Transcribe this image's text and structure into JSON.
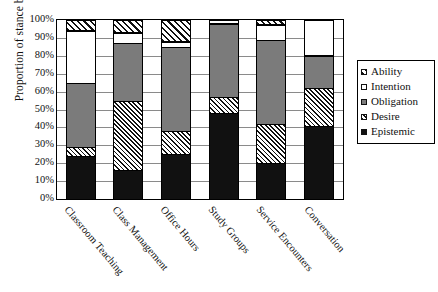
{
  "chart_data": {
    "type": "bar",
    "subtype": "stacked-100-percent",
    "title": "",
    "xlabel": "",
    "ylabel": "Proportion of stance bundles",
    "ylim": [
      0,
      100
    ],
    "ytick_labels": [
      "0%",
      "10%",
      "20%",
      "30%",
      "40%",
      "50%",
      "60%",
      "70%",
      "80%",
      "90%",
      "100%"
    ],
    "ytick_values": [
      0,
      10,
      20,
      30,
      40,
      50,
      60,
      70,
      80,
      90,
      100
    ],
    "grid": true,
    "legend_position": "right",
    "categories": [
      "Classroom Teaching",
      "Class Management",
      "Office Hours",
      "Study Groups",
      "Service Encounters",
      "Conversation"
    ],
    "series": [
      {
        "name": "Epistemic",
        "fill": "solid-black",
        "color": "#111111",
        "values": [
          24,
          16,
          25,
          48,
          20,
          41
        ]
      },
      {
        "name": "Desire",
        "fill": "dense-hatch",
        "color": "#ffffff",
        "values": [
          5,
          39,
          13,
          9,
          22,
          21
        ]
      },
      {
        "name": "Obligation",
        "fill": "solid-gray",
        "color": "#7b7b7b",
        "values": [
          36,
          32,
          47,
          41,
          47,
          18
        ]
      },
      {
        "name": "Intention",
        "fill": "empty-white",
        "color": "#ffffff",
        "values": [
          29,
          6,
          3,
          2,
          8,
          20
        ]
      },
      {
        "name": "Ability",
        "fill": "diagonal-hatch",
        "color": "#ffffff",
        "values": [
          6,
          7,
          12,
          0,
          3,
          0
        ]
      }
    ],
    "legend_entries": [
      {
        "label": "Ability",
        "fill": "diagonal-hatch"
      },
      {
        "label": "Intention",
        "fill": "empty-white"
      },
      {
        "label": "Obligation",
        "fill": "solid-gray"
      },
      {
        "label": "Desire",
        "fill": "dense-hatch"
      },
      {
        "label": "Epistemic",
        "fill": "solid-black"
      }
    ]
  }
}
